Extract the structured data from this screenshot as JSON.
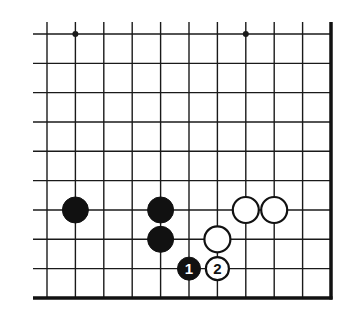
{
  "diagram": {
    "type": "go-board-fragment",
    "corner": "bottom-right",
    "columns": 11,
    "rows": 10,
    "grid": {
      "x0": 47,
      "dx": 28.4,
      "y0": 34,
      "dy": 29.33,
      "open_left_x": 33,
      "open_top_y": 22,
      "right_edge_x": 331,
      "bottom_edge_y": 298,
      "line_color": "#1a1a1a",
      "edge_color": "#111111"
    },
    "star_points": [
      {
        "col": 1,
        "row": 0
      },
      {
        "col": 7,
        "row": 0
      }
    ],
    "stones": [
      {
        "color": "black",
        "col": 1,
        "row": 6,
        "label": ""
      },
      {
        "color": "black",
        "col": 4,
        "row": 6,
        "label": ""
      },
      {
        "color": "black",
        "col": 4,
        "row": 7,
        "label": ""
      },
      {
        "color": "white",
        "col": 7,
        "row": 6,
        "label": ""
      },
      {
        "color": "white",
        "col": 8,
        "row": 6,
        "label": ""
      },
      {
        "color": "white",
        "col": 6,
        "row": 7,
        "label": ""
      },
      {
        "color": "black",
        "col": 5,
        "row": 8,
        "label": "1"
      },
      {
        "color": "white",
        "col": 6,
        "row": 8,
        "label": "2"
      }
    ],
    "colors": {
      "black_stone": "#111111",
      "white_stone": "#ffffff",
      "stone_outline": "#111111"
    }
  }
}
